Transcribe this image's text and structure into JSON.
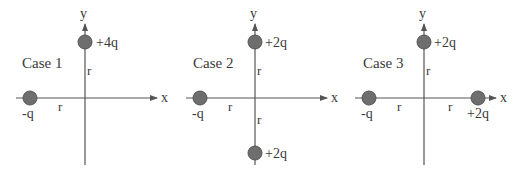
{
  "figure": {
    "colors": {
      "axis": "#555555",
      "charge_fill": "#6e6e6e",
      "text": "#3a3a3a"
    },
    "cases": [
      {
        "title": "Case 1",
        "x_label": "x",
        "y_label": "y",
        "charges": [
          {
            "label": "-q",
            "position": "x = -r"
          },
          {
            "label": "+4q",
            "position": "y = +r"
          }
        ],
        "distances": [
          "r",
          "r"
        ]
      },
      {
        "title": "Case 2",
        "x_label": "x",
        "y_label": "y",
        "charges": [
          {
            "label": "-q",
            "position": "x = -r"
          },
          {
            "label": "+2q",
            "position": "y = +r"
          },
          {
            "label": "+2q",
            "position": "y = -r"
          }
        ],
        "distances": [
          "r",
          "r",
          "r"
        ]
      },
      {
        "title": "Case 3",
        "x_label": "x",
        "y_label": "y",
        "charges": [
          {
            "label": "-q",
            "position": "x = -r"
          },
          {
            "label": "+2q",
            "position": "y = +r"
          },
          {
            "label": "+2q",
            "position": "x = +r"
          }
        ],
        "distances": [
          "r",
          "r",
          "r"
        ]
      }
    ]
  }
}
